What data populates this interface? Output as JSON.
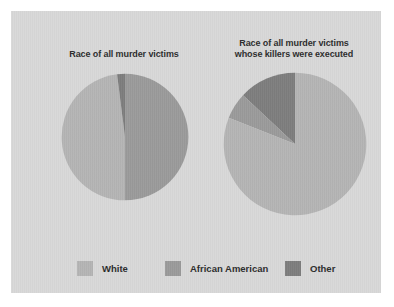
{
  "figure": {
    "background_color": "#d8d8d8",
    "outer_background_color": "#ffffff"
  },
  "colors": {
    "white_category": "#b4b4b4",
    "african_american_category": "#9a9a9a",
    "other_category": "#7d7d7d",
    "title_text": "#2c2c2c",
    "legend_text": "#2b2b2b"
  },
  "legend": {
    "position": "bottom",
    "items": [
      {
        "label": "White",
        "color": "#b4b4b4",
        "key": "white"
      },
      {
        "label": "African American",
        "color": "#9a9a9a",
        "key": "african_american"
      },
      {
        "label": "Other",
        "color": "#7d7d7d",
        "key": "other"
      }
    ]
  },
  "chart_data": [
    {
      "type": "pie",
      "id": "victims-all",
      "title": "Race of all murder victims",
      "xlabel": "",
      "ylabel": "",
      "grid": false,
      "start_angle_deg": 0,
      "direction": "clockwise",
      "labels": [
        "African American",
        "White",
        "Other"
      ],
      "values": [
        50,
        48,
        2
      ],
      "slices": [
        {
          "label": "African American",
          "value": 50,
          "color": "#9a9a9a"
        },
        {
          "label": "White",
          "value": 48,
          "color": "#b4b4b4"
        },
        {
          "label": "Other",
          "value": 2,
          "color": "#7d7d7d"
        }
      ]
    },
    {
      "type": "pie",
      "id": "victims-killers-executed",
      "title": "Race of all murder victims\nwhose killers were executed",
      "xlabel": "",
      "ylabel": "",
      "grid": false,
      "start_angle_deg": 0,
      "direction": "counter-clockwise",
      "labels": [
        "Other",
        "African American",
        "White"
      ],
      "values": [
        13,
        6,
        81
      ],
      "slices": [
        {
          "label": "Other",
          "value": 13,
          "color": "#7d7d7d"
        },
        {
          "label": "African American",
          "value": 6,
          "color": "#9a9a9a"
        },
        {
          "label": "White",
          "value": 81,
          "color": "#b4b4b4"
        }
      ]
    }
  ]
}
